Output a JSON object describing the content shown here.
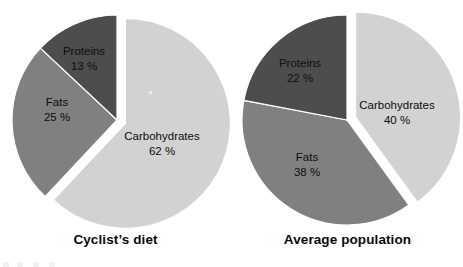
{
  "figure": {
    "width": 463,
    "height": 267,
    "background": "#ffffff"
  },
  "palette": {
    "carbohydrates": "#d2d2d2",
    "fats": "#808080",
    "proteins": "#4d4d4d",
    "slice_border": "#ffffff",
    "label_text": "#0d0d0d",
    "title_text": "#0a0a0a"
  },
  "chart_data": [
    {
      "type": "pie",
      "id": "cyclist-diet",
      "title": "Cyclist’s diet",
      "categories": [
        "Carbohydrates",
        "Fats",
        "Proteins"
      ],
      "values": [
        62,
        25,
        13
      ],
      "value_labels": [
        "62 %",
        "25 %",
        "13 %"
      ],
      "unit": "%",
      "colors": [
        "#d2d2d2",
        "#808080",
        "#4d4d4d"
      ],
      "start_angle_deg": 0,
      "direction": "clockwise",
      "exploded_slice": "Carbohydrates",
      "explode_offset_px": 9,
      "center": [
        117,
        120
      ],
      "radius": 105,
      "legend": "none",
      "labels_inside": true,
      "label_positions": [
        {
          "category": "Carbohydrates",
          "x": 162,
          "y": 137
        },
        {
          "category": "Fats",
          "x": 57,
          "y": 103
        },
        {
          "category": "Proteins",
          "x": 84,
          "y": 52
        }
      ]
    },
    {
      "type": "pie",
      "id": "average-population",
      "title": "Average population",
      "categories": [
        "Carbohydrates",
        "Fats",
        "Proteins"
      ],
      "values": [
        40,
        38,
        22
      ],
      "value_labels": [
        "40 %",
        "38 %",
        "22 %"
      ],
      "unit": "%",
      "colors": [
        "#d2d2d2",
        "#808080",
        "#4d4d4d"
      ],
      "start_angle_deg": 0,
      "direction": "clockwise",
      "exploded_slice": "Carbohydrates",
      "explode_offset_px": 9,
      "center": [
        115,
        120
      ],
      "radius": 105,
      "legend": "none",
      "labels_inside": true,
      "label_positions": [
        {
          "category": "Carbohydrates",
          "x": 165,
          "y": 106
        },
        {
          "category": "Fats",
          "x": 75,
          "y": 158
        },
        {
          "category": "Proteins",
          "x": 68,
          "y": 64
        }
      ]
    }
  ]
}
